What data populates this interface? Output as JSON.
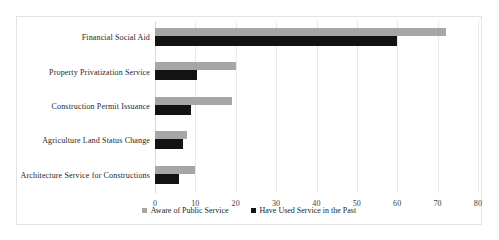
{
  "chart_data": {
    "type": "bar",
    "orientation": "horizontal",
    "title": "",
    "xlabel": "",
    "ylabel": "",
    "xlim": [
      0,
      80
    ],
    "xticks": [
      0,
      10,
      20,
      30,
      40,
      50,
      60,
      70,
      80
    ],
    "grid": true,
    "legend_position": "bottom-center",
    "categories": [
      "Financial Social Aid",
      "Property Privatization Service",
      "Construction Permit Issuance",
      "Agriculture Land Status Change",
      "Architecture Service for Constructions"
    ],
    "series": [
      {
        "name": "Aware of Public Service",
        "color": "#a6a6a6",
        "values": [
          72,
          20,
          19,
          8,
          10
        ]
      },
      {
        "name": "Have Used Service in the Past",
        "color": "#131313",
        "values": [
          60,
          10.5,
          9,
          7,
          6
        ]
      }
    ]
  },
  "legend": [
    {
      "label": "Aware of Public Service",
      "swatch": "legend-swatch-gray"
    },
    {
      "label": "Have Used Service in the Past",
      "swatch": "legend-swatch-black"
    }
  ],
  "axis": {
    "tick_labels": [
      "0",
      "10",
      "20",
      "30",
      "40",
      "50",
      "60",
      "70",
      "80"
    ]
  },
  "colors": {
    "aware": "#a6a6a6",
    "used": "#131313",
    "grid": "#e8e8e8",
    "border": "#e2e2e2",
    "text": "#1e1e1e",
    "background": "#ffffff"
  }
}
